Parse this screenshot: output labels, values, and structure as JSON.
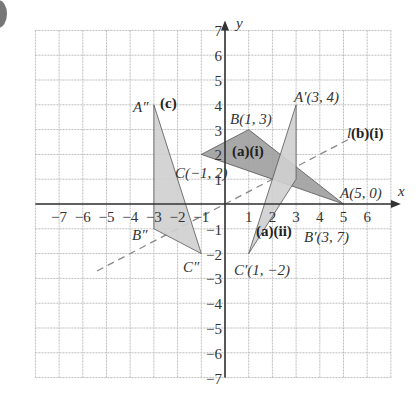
{
  "axes": {
    "x_label": "x",
    "y_label": "y",
    "x_ticks": [
      "−7",
      "−6",
      "−5",
      "−4",
      "−3",
      "−2",
      "−1",
      "1",
      "2",
      "3",
      "4",
      "5",
      "6"
    ],
    "y_ticks": [
      "7",
      "6",
      "5",
      "4",
      "3",
      "2",
      "1",
      "−1",
      "−2",
      "−3",
      "−4",
      "−5",
      "−6",
      "−7"
    ],
    "x_range": [
      -8,
      7
    ],
    "y_range": [
      -7,
      7
    ]
  },
  "labels": {
    "B": "B(1, 3)",
    "C": "C(−1, 2)",
    "A": "A(5, 0)",
    "A1": "A′(3, 4)",
    "B1": "B′(3, 7)",
    "C1": "C′(1, −2)",
    "A2": "A″",
    "B2": "B″",
    "C2": "C″",
    "part_a_i": "(a)(i)",
    "part_a_ii": "(a)(ii)",
    "part_c": "(c)",
    "line_l": "l",
    "part_b_i": "(b)(i)"
  },
  "colors": {
    "grid": "#bdbdbd",
    "axis": "#333333",
    "triangle_dark": "#9e9e9e",
    "triangle_light": "#cfcfcf",
    "dashed_line": "#888888"
  },
  "chart_data": {
    "type": "diagram",
    "title": "",
    "grid": true,
    "x_range": [
      -8,
      7
    ],
    "y_range": [
      -7,
      7
    ],
    "shapes": [
      {
        "name": "triangle ABC (a)(i)",
        "vertices": [
          [
            1,
            3
          ],
          [
            -1,
            2
          ],
          [
            5,
            0
          ]
        ],
        "fill": "dark"
      },
      {
        "name": "triangle A'B'C' (a)(ii)",
        "vertices": [
          [
            3,
            4
          ],
          [
            3,
            1
          ],
          [
            1,
            -2
          ]
        ],
        "fill": "light"
      },
      {
        "name": "triangle A''B''C'' (c)",
        "vertices": [
          [
            -3,
            4
          ],
          [
            -3,
            -1
          ],
          [
            -1,
            -2
          ]
        ],
        "fill": "light"
      }
    ],
    "lines": [
      {
        "name": "l",
        "equation": "y = x/2",
        "style": "dashed",
        "from": [
          -5.4,
          -2.7
        ],
        "to": [
          5.3,
          2.65
        ]
      }
    ]
  }
}
